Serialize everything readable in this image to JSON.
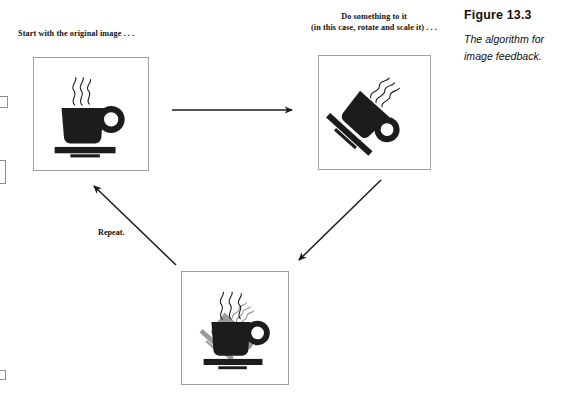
{
  "figure": {
    "title": "Figure 13.3",
    "description": "The algorithm for image feedback."
  },
  "steps": {
    "step1_caption": "Start with the original image  . . .",
    "step2_caption_line1": "Do something to it",
    "step2_caption_line2": "(in this case, rotate and scale it) . . .",
    "repeat_label": "Repeat."
  },
  "frames": [
    {
      "name": "original-image-frame",
      "alt": "coffee cup and saucer, upright"
    },
    {
      "name": "transformed-image-frame",
      "alt": "coffee cup rotated and scaled"
    },
    {
      "name": "feedback-image-frame",
      "alt": "coffee cup with rotated gray copy behind it"
    }
  ],
  "arrows": [
    {
      "name": "arrow-original-to-transformed",
      "direction": "right"
    },
    {
      "name": "arrow-transformed-to-feedback",
      "direction": "down-left"
    },
    {
      "name": "arrow-feedback-to-original",
      "direction": "up-left",
      "label": "Repeat."
    }
  ],
  "colors": {
    "ink": "#111111",
    "cup_black": "#1c1c1c",
    "cup_gray": "#9a9a9a",
    "frame_border": "#a0a0a0",
    "background": "#ffffff"
  }
}
